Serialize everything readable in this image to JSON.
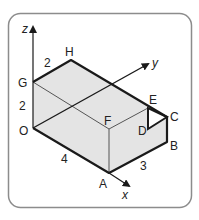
{
  "diagram": {
    "type": "3d-cuboid",
    "axes": {
      "x": "x",
      "y": "y",
      "z": "z"
    },
    "vertices": {
      "O": "O",
      "A": "A",
      "B": "B",
      "C": "C",
      "D": "D",
      "E": "E",
      "F": "F",
      "G": "G",
      "H": "H"
    },
    "dimensions": {
      "OA": "4",
      "AB": "3",
      "OG": "2",
      "GH": "2"
    },
    "colors": {
      "frame": "#8c8c8c",
      "face_fill": "#e4e4e4",
      "edge": "#1a1a1a",
      "hidden": "#555555"
    }
  }
}
